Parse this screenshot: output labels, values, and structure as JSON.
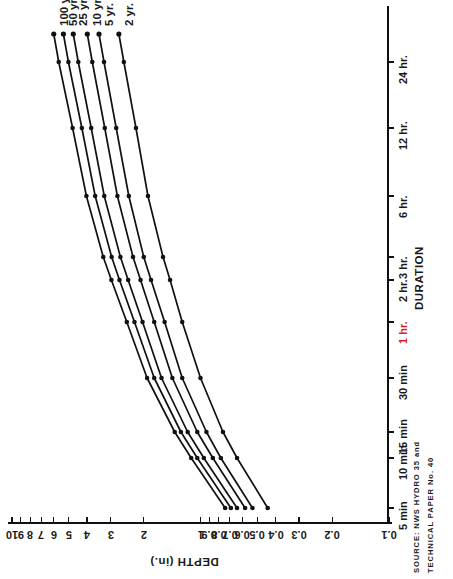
{
  "chart_data": {
    "type": "line",
    "title": "",
    "xlabel": "DEPTH (in.)",
    "ylabel": "DURATION",
    "xscale": "log",
    "xlim": [
      0.1,
      10
    ],
    "xticks": [
      "0.1",
      "0.2",
      "0.3",
      "0.4",
      "0.5",
      "0.6",
      "0.7",
      "0.8",
      "0.9",
      "1",
      "2",
      "3",
      "4",
      "5",
      "6",
      "7",
      "8",
      "9",
      "10"
    ],
    "yticks": [
      "5 min",
      "10 min",
      "15 min",
      "30 min",
      "1 hr.",
      "2 hr.",
      "3 hr.",
      "6 hr.",
      "12 hr.",
      "24 hr."
    ],
    "y_highlight_tick": "1 hr.",
    "y_highlight_color": "#d41f1f",
    "grid": false,
    "legend": "inline-curve-labels",
    "legend_position": "top-left",
    "categories": [
      "5 min",
      "10 min",
      "15 min",
      "30 min",
      "1 hr.",
      "2 hr.",
      "3 hr.",
      "6 hr.",
      "12 hr.",
      "24 hr."
    ],
    "series": [
      {
        "name": "2 yr.",
        "values": [
          0.44,
          0.64,
          0.76,
          1.0,
          1.25,
          1.45,
          1.58,
          1.9,
          2.2,
          2.55
        ]
      },
      {
        "name": "5 yr.",
        "values": [
          0.53,
          0.78,
          0.93,
          1.25,
          1.55,
          1.83,
          2.0,
          2.4,
          2.8,
          3.25
        ]
      },
      {
        "name": "10 yr.",
        "values": [
          0.58,
          0.86,
          1.04,
          1.41,
          1.76,
          2.08,
          2.28,
          2.76,
          3.22,
          3.75
        ]
      },
      {
        "name": "25 yr.",
        "values": [
          0.64,
          0.96,
          1.17,
          1.61,
          2.03,
          2.42,
          2.66,
          3.24,
          3.8,
          4.45
        ]
      },
      {
        "name": "50 yr.",
        "values": [
          0.69,
          1.04,
          1.27,
          1.76,
          2.24,
          2.69,
          2.96,
          3.62,
          4.26,
          5.02
        ]
      },
      {
        "name": "100 yr.",
        "values": [
          0.74,
          1.12,
          1.37,
          1.92,
          2.46,
          2.97,
          3.28,
          4.03,
          4.77,
          5.65
        ]
      }
    ],
    "source_lines": [
      "SOURCE: NWS HYDRO 35 and",
      "TECHNICAL PAPER No. 40"
    ]
  },
  "axes": {
    "depth": {
      "title": "DEPTH (in.)",
      "ticks": [
        {
          "label": "0.1",
          "major": true
        },
        {
          "label": "0.2",
          "major": true
        },
        {
          "label": "0.3",
          "major": true
        },
        {
          "label": "0.4",
          "major": true
        },
        {
          "label": "0.5",
          "major": true
        },
        {
          "label": "0.6",
          "major": true
        },
        {
          "label": "0.7",
          "major": true
        },
        {
          "label": "0.8",
          "major": true
        },
        {
          "label": "0.9",
          "major": true
        },
        {
          "label": "1",
          "major": true
        },
        {
          "label": "2",
          "major": true
        },
        {
          "label": "3",
          "major": true
        },
        {
          "label": "4",
          "major": true
        },
        {
          "label": "5",
          "major": true
        },
        {
          "label": "6",
          "major": true
        },
        {
          "label": "7",
          "major": true
        },
        {
          "label": "8",
          "major": true
        },
        {
          "label": "9",
          "major": true
        },
        {
          "label": "10",
          "major": true
        }
      ]
    },
    "duration": {
      "title": "DURATION",
      "ticks": [
        {
          "label": "5 min"
        },
        {
          "label": "10 min"
        },
        {
          "label": "15 min"
        },
        {
          "label": "30 min"
        },
        {
          "label": "1 hr."
        },
        {
          "label": "2 hr."
        },
        {
          "label": "3 hr."
        },
        {
          "label": "6 hr."
        },
        {
          "label": "12 hr."
        },
        {
          "label": "24 hr."
        }
      ]
    }
  },
  "curve_labels": [
    "100 yr.",
    "50 yr.",
    "25 yr.",
    "10 yr.",
    "5 yr.",
    "2 yr."
  ],
  "source": {
    "line1": "SOURCE: NWS HYDRO 35 and",
    "line2": "TECHNICAL PAPER No. 40"
  },
  "colors": {
    "curve": "#111111",
    "axis": "#111111",
    "highlight": "#d41f1f",
    "background": "#ffffff"
  }
}
